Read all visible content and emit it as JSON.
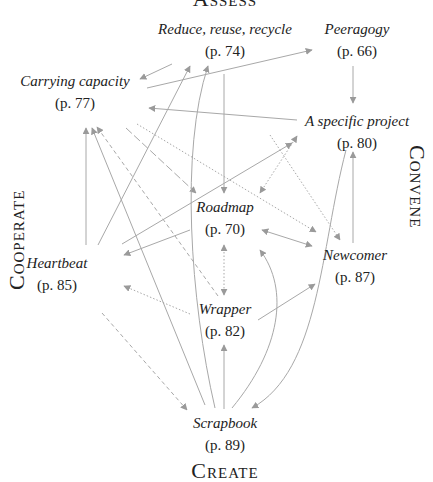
{
  "diagram": {
    "groups": {
      "top": "Assess",
      "left": "Cooperate",
      "right": "Convene",
      "bottom": "Create"
    },
    "nodes": [
      {
        "id": "rrr",
        "title": "Reduce, reuse, recycle",
        "page": "(p. 74)",
        "x": 225,
        "y": 16
      },
      {
        "id": "peer",
        "title": "Peeragogy",
        "page": "(p. 66)",
        "x": 357,
        "y": 16
      },
      {
        "id": "cc",
        "title": "Carrying capacity",
        "page": "(p. 77)",
        "x": 70,
        "y": 68
      },
      {
        "id": "asp",
        "title": "A specific project",
        "page": "(p. 80)",
        "x": 357,
        "y": 108
      },
      {
        "id": "road",
        "title": "Roadmap",
        "page": "(p. 70)",
        "x": 225,
        "y": 194
      },
      {
        "id": "heart",
        "title": "Heartbeat",
        "page": "(p. 85)",
        "x": 57,
        "y": 258
      },
      {
        "id": "new",
        "title": "Newcomer",
        "page": "(p. 87)",
        "x": 354,
        "y": 248
      },
      {
        "id": "wrap",
        "title": "Wrapper",
        "page": "(p. 82)",
        "x": 225,
        "y": 300
      },
      {
        "id": "scrap",
        "title": "Scrapbook",
        "page": "(p. 89)",
        "x": 225,
        "y": 414
      }
    ],
    "edge_color": "#9a9a9a",
    "edges": [
      {
        "from": "rrr",
        "to": "cc",
        "style": "solid"
      },
      {
        "from": "rrr",
        "to": "road",
        "style": "solid"
      },
      {
        "from": "rrr",
        "to": "new",
        "style": "dotted"
      },
      {
        "from": "peer",
        "to": "asp",
        "style": "solid"
      },
      {
        "from": "cc",
        "to": "peer",
        "style": "solid"
      },
      {
        "from": "asp",
        "to": "cc",
        "style": "solid"
      },
      {
        "from": "asp",
        "to": "road",
        "style": "dotted"
      },
      {
        "from": "road",
        "to": "asp",
        "style": "dotted"
      },
      {
        "from": "cc",
        "to": "road",
        "style": "dashed"
      },
      {
        "from": "cc",
        "to": "new",
        "style": "dotted"
      },
      {
        "from": "heart",
        "to": "cc",
        "style": "solid"
      },
      {
        "from": "heart",
        "to": "rrr",
        "style": "solid"
      },
      {
        "from": "road",
        "to": "heart",
        "style": "solid"
      },
      {
        "from": "heart",
        "to": "asp",
        "style": "solid"
      },
      {
        "from": "road",
        "to": "new",
        "style": "solid"
      },
      {
        "from": "new",
        "to": "road",
        "style": "solid"
      },
      {
        "from": "new",
        "to": "asp",
        "style": "solid"
      },
      {
        "from": "road",
        "to": "wrap",
        "style": "dotted"
      },
      {
        "from": "wrap",
        "to": "road",
        "style": "dotted"
      },
      {
        "from": "wrap",
        "to": "heart",
        "style": "dotted"
      },
      {
        "from": "wrap",
        "to": "new",
        "style": "solid"
      },
      {
        "from": "scrap",
        "to": "wrap",
        "style": "solid"
      },
      {
        "from": "scrap",
        "to": "rrr",
        "style": "solid"
      },
      {
        "from": "scrap",
        "to": "road",
        "style": "solid"
      },
      {
        "from": "scrap",
        "to": "cc",
        "style": "solid"
      },
      {
        "from": "heart",
        "to": "scrap",
        "style": "dashed"
      },
      {
        "from": "wrap",
        "to": "cc",
        "style": "dashed"
      },
      {
        "from": "asp",
        "to": "scrap",
        "style": "solid"
      }
    ]
  }
}
